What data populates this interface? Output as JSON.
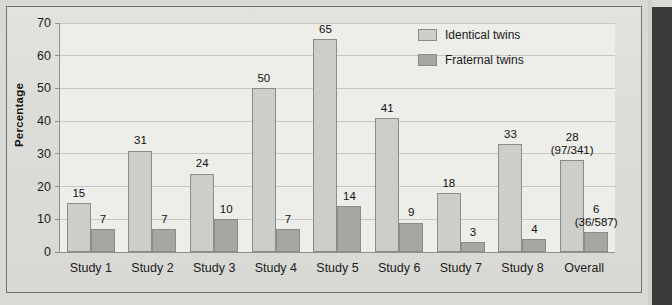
{
  "chart_data": {
    "type": "bar",
    "title": "",
    "xlabel": "",
    "ylabel": "Percentage",
    "ylim": [
      0,
      70
    ],
    "yticks": [
      0,
      10,
      20,
      30,
      40,
      50,
      60,
      70
    ],
    "grid": true,
    "legend_position": "top-right",
    "categories": [
      "Study 1",
      "Study 2",
      "Study 3",
      "Study 4",
      "Study 5",
      "Study 6",
      "Study 7",
      "Study 8",
      "Overall"
    ],
    "series": [
      {
        "name": "Identical twins",
        "color": "#cdcdc9",
        "values": [
          15,
          31,
          24,
          50,
          65,
          41,
          18,
          33,
          28
        ],
        "labels": [
          "15",
          "31",
          "24",
          "50",
          "65",
          "41",
          "18",
          "33",
          "28"
        ],
        "sublabels": [
          "",
          "",
          "",
          "",
          "",
          "",
          "",
          "",
          "(97/341)"
        ]
      },
      {
        "name": "Fraternal twins",
        "color": "#a6a6a2",
        "values": [
          7,
          7,
          10,
          7,
          14,
          9,
          3,
          4,
          6
        ],
        "labels": [
          "7",
          "7",
          "10",
          "7",
          "14",
          "9",
          "3",
          "4",
          "6"
        ],
        "sublabels": [
          "",
          "",
          "",
          "",
          "",
          "",
          "",
          "",
          "(36/587)"
        ]
      }
    ]
  },
  "legend": {
    "items": [
      {
        "label": "Identical twins",
        "swatch": "identical"
      },
      {
        "label": "Fraternal twins",
        "swatch": "fraternal"
      }
    ]
  },
  "axis": {
    "y_title": "Percentage",
    "y_tick_labels": [
      "70",
      "60",
      "50",
      "40",
      "30",
      "20",
      "10",
      "0"
    ],
    "x_tick_labels": [
      "Study 1",
      "Study 2",
      "Study 3",
      "Study 4",
      "Study 5",
      "Study 6",
      "Study 7",
      "Study 8",
      "Overall"
    ]
  }
}
